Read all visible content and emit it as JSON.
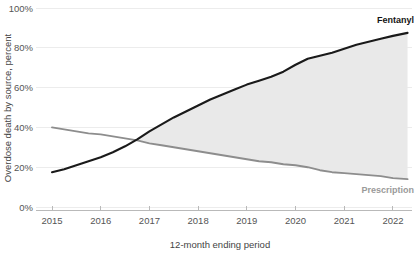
{
  "chart_data": {
    "type": "line",
    "title": "",
    "subtitle": "",
    "xlabel": "12-month ending period",
    "ylabel": "Overdose death by source, percent",
    "grid": true,
    "legend_position": "inline-right-end-of-line",
    "xlim": [
      2015.0,
      2022.35
    ],
    "ylim": [
      0,
      100
    ],
    "y_ticks": [
      0,
      20,
      40,
      60,
      80,
      100
    ],
    "y_tick_labels": [
      "0%",
      "20%",
      "40%",
      "60%",
      "80%",
      "100%"
    ],
    "x_ticks": [
      2015,
      2016,
      2017,
      2018,
      2019,
      2020,
      2021,
      2022
    ],
    "x_tick_labels": [
      "2015",
      "2016",
      "2017",
      "2018",
      "2019",
      "2020",
      "2021",
      "2022"
    ],
    "annotations": [
      {
        "text": "Fentanyl",
        "series": "Fentanyl",
        "x": 2022.3,
        "y": 88
      },
      {
        "text": "Prescription",
        "series": "Prescription",
        "x": 2022.3,
        "y": 14
      }
    ],
    "shaded_band": {
      "between": [
        "Fentanyl",
        "Prescription"
      ],
      "color": "#e9e9e9",
      "starts_at_crossover": true,
      "crossover_x": 2016.45,
      "crossover_y": 33
    },
    "x": [
      2015.0,
      2015.25,
      2015.5,
      2015.75,
      2016.0,
      2016.25,
      2016.5,
      2016.75,
      2017.0,
      2017.25,
      2017.5,
      2017.75,
      2018.0,
      2018.25,
      2018.5,
      2018.75,
      2019.0,
      2019.25,
      2019.5,
      2019.75,
      2020.0,
      2020.25,
      2020.5,
      2020.75,
      2021.0,
      2021.25,
      2021.5,
      2021.75,
      2022.0,
      2022.3
    ],
    "series": [
      {
        "name": "Fentanyl",
        "color": "#1a1a1a",
        "label": "Fentanyl",
        "values": [
          17.5,
          19.0,
          21.0,
          23.0,
          25.0,
          27.5,
          30.5,
          34.0,
          38.0,
          41.5,
          45.0,
          48.0,
          51.0,
          54.0,
          56.5,
          59.0,
          61.5,
          63.5,
          65.5,
          68.0,
          71.5,
          74.5,
          76.0,
          77.5,
          79.5,
          81.5,
          83.0,
          84.5,
          86.0,
          87.5
        ]
      },
      {
        "name": "Prescription",
        "color": "#8d8d8d",
        "label": "Prescription",
        "values": [
          40.0,
          39.0,
          38.0,
          37.0,
          36.5,
          35.5,
          34.5,
          33.5,
          32.0,
          31.0,
          30.0,
          29.0,
          28.0,
          27.0,
          26.0,
          25.0,
          24.0,
          23.0,
          22.5,
          21.5,
          21.0,
          20.0,
          18.5,
          17.5,
          17.0,
          16.5,
          16.0,
          15.5,
          14.5,
          14.0
        ]
      }
    ]
  },
  "axes": {
    "y_title": "Overdose death by source, percent",
    "x_title": "12-month ending period"
  },
  "labels": {
    "fentanyl": "Fentanyl",
    "prescription": "Prescription"
  },
  "colors": {
    "fentanyl_line": "#1a1a1a",
    "prescription_line": "#8d8d8d",
    "band_fill": "#e9e9e9",
    "gridline": "#ececec",
    "axis": "#b9b9b9",
    "tick_text": "#555555",
    "background": "#ffffff"
  }
}
